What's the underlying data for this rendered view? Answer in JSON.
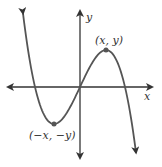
{
  "graph": {
    "x_axis_label": "x",
    "y_axis_label": "y",
    "max_point_label": "(x, y)",
    "min_point_label": "(−x, −y)",
    "curve_color": "#555555",
    "axis_color": "#333333",
    "point_color": "#555555"
  }
}
